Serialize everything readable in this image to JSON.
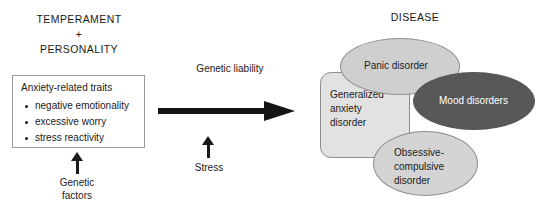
{
  "left": {
    "heading_lines": [
      "TEMPERAMENT",
      "+",
      "PERSONALITY"
    ],
    "traits_box": {
      "title": "Anxiety-related traits",
      "items": [
        "negative emotionality",
        "excessive worry",
        "stress reactivity"
      ]
    },
    "genetic_factors_caption": "Genetic\nfactors"
  },
  "middle": {
    "genetic_liability_label": "Genetic liability",
    "stress_caption": "Stress"
  },
  "right": {
    "title": "DISEASE",
    "shapes": [
      {
        "id": "gad",
        "label": "Generalized\nanxiety\ndisorder",
        "shape": "rounded-rect",
        "fill": "#e2e2e2",
        "text_color": "#1a1a1a"
      },
      {
        "id": "panic",
        "label": "Panic disorder",
        "shape": "ellipse",
        "fill": "#cfcfcf",
        "text_color": "#1a1a1a"
      },
      {
        "id": "mood",
        "label": "Mood disorders",
        "shape": "ellipse",
        "fill": "#585858",
        "text_color": "#ffffff"
      },
      {
        "id": "ocd",
        "label": "Obsessive-\ncompulsive\ndisorder",
        "shape": "ellipse",
        "fill": "#d4d4d4",
        "text_color": "#1a1a1a"
      }
    ]
  },
  "colors": {
    "ink": "#1a1a1a",
    "arrow": "#141414",
    "outline": "#8e8e8e",
    "box_border": "#9a9a9a",
    "background": "#ffffff"
  }
}
